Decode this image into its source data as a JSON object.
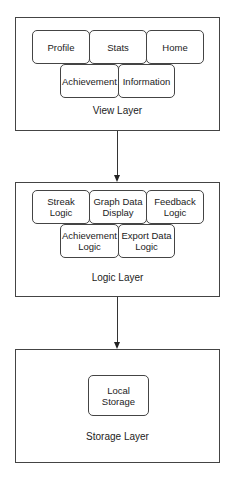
{
  "diagram": {
    "layers": [
      {
        "id": "view",
        "label": "View Layer",
        "nodes": [
          {
            "label": "Profile"
          },
          {
            "label": "Stats"
          },
          {
            "label": "Home"
          },
          {
            "label": "Achievement"
          },
          {
            "label": "Information"
          }
        ]
      },
      {
        "id": "logic",
        "label": "Logic Layer",
        "nodes": [
          {
            "label": "Streak\nLogic"
          },
          {
            "label": "Graph Data\nDisplay"
          },
          {
            "label": "Feedback\nLogic"
          },
          {
            "label": "Achievement\nLogic"
          },
          {
            "label": "Export Data\nLogic"
          }
        ]
      },
      {
        "id": "storage",
        "label": "Storage Layer",
        "nodes": [
          {
            "label": "Local\nStorage"
          }
        ]
      }
    ],
    "edges": [
      {
        "from": "view",
        "to": "logic"
      },
      {
        "from": "logic",
        "to": "storage"
      }
    ],
    "colors": {
      "stroke": "#444444",
      "background": "#ffffff",
      "text": "#222222"
    }
  }
}
